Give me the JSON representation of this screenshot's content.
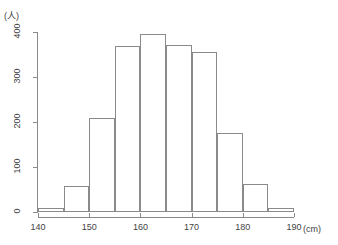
{
  "chart_data": {
    "type": "bar",
    "title": "",
    "subtitle": "",
    "xlabel": "(cm)",
    "ylabel": "(人)",
    "categories": [
      "140-145",
      "145-150",
      "150-155",
      "155-160",
      "160-165",
      "165-170",
      "170-175",
      "175-180",
      "180-185",
      "185-190"
    ],
    "bin_edges": [
      140,
      145,
      150,
      155,
      160,
      165,
      170,
      175,
      180,
      185,
      190
    ],
    "values": [
      8,
      58,
      210,
      370,
      395,
      372,
      355,
      175,
      62,
      10
    ],
    "xlim": [
      140,
      190
    ],
    "ylim": [
      0,
      400
    ],
    "xticks": [
      140,
      150,
      160,
      170,
      180,
      190
    ],
    "yticks": [
      0,
      100,
      200,
      300,
      400
    ],
    "xtick_labels": [
      "140",
      "150",
      "160",
      "170",
      "180",
      "190"
    ],
    "ytick_labels": [
      "0",
      "100",
      "200",
      "300",
      "400"
    ],
    "grid": false,
    "legend": false,
    "legend_position": "none",
    "series": [
      {
        "name": "度数",
        "values": [
          8,
          58,
          210,
          370,
          395,
          372,
          355,
          175,
          62,
          10
        ]
      }
    ]
  },
  "colors": {
    "bar_stroke": "#8a8a8a",
    "bar_fill": "transparent",
    "axis": "#8a8a8a",
    "text": "#3f3f3f",
    "background": "#ffffff"
  },
  "axes": {
    "y_unit_label": "(人)",
    "x_unit_label": "(cm)"
  }
}
